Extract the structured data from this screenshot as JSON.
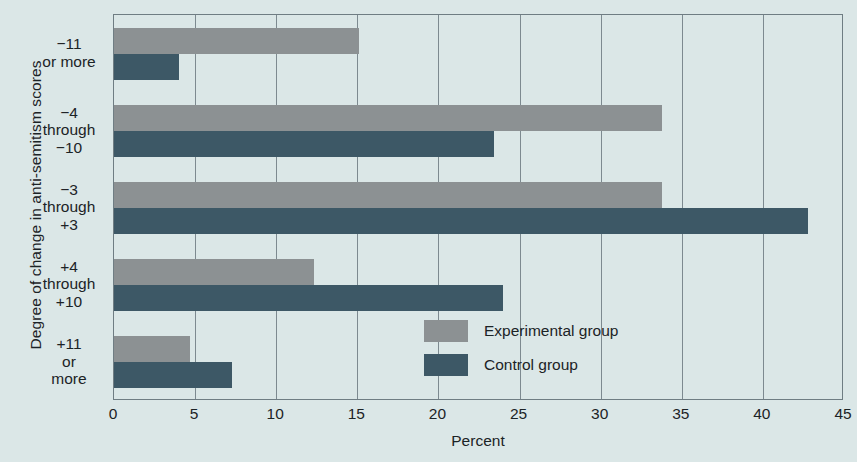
{
  "chart_data": {
    "type": "bar",
    "orientation": "horizontal",
    "title": "",
    "xlabel": "Percent",
    "ylabel": "Degree of change in anti-semitism scores",
    "xlim": [
      0,
      45
    ],
    "xticks": [
      0,
      5,
      10,
      15,
      20,
      25,
      30,
      35,
      40,
      45
    ],
    "grid": true,
    "grid_axis": "x",
    "legend_position": "inside-lower-right",
    "categories": [
      "−11\nor more",
      "−4\nthrough\n−10",
      "−3\nthrough\n+3",
      "+4\nthrough\n+10",
      "+11\nor\nmore"
    ],
    "series": [
      {
        "name": "Experimental group",
        "color": "#8c9193",
        "values": [
          15.1,
          33.8,
          33.8,
          12.3,
          4.7
        ]
      },
      {
        "name": "Control group",
        "color": "#3d5866",
        "values": [
          4.0,
          23.4,
          42.8,
          24.0,
          7.3
        ]
      }
    ]
  },
  "colors": {
    "background": "#dbe7e7",
    "axis": "#6f7d83",
    "grid": "#7d8a90",
    "text": "#1b2326",
    "experimental": "#8c9193",
    "control": "#3d5866"
  }
}
